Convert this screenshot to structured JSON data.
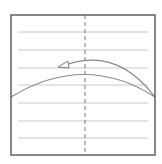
{
  "diagram": {
    "type": "origami-fold-step",
    "colors": {
      "background": "#ffffff",
      "border": "#555555",
      "crease": "#c8c8c8",
      "center_dash": "#777777",
      "curve": "#888888",
      "arrow": "#777777"
    },
    "square": {
      "x": 11,
      "y": 15,
      "w": 144,
      "h": 140
    },
    "center_line": {
      "x": 85,
      "y1": 15,
      "y2": 155,
      "style": "dashed"
    },
    "crease_lines": [
      {
        "y": 32
      },
      {
        "y": 50
      },
      {
        "y": 68
      },
      {
        "y": 85
      },
      {
        "y": 103
      },
      {
        "y": 121
      },
      {
        "y": 138
      }
    ],
    "crease_inset": {
      "x1": 18,
      "x2": 148
    },
    "fold_curve": {
      "start": [
        11,
        97
      ],
      "control": [
        85,
        52
      ],
      "end": [
        155,
        97
      ]
    },
    "arrow_curve": {
      "start": [
        155,
        97
      ],
      "control": [
        118,
        48
      ],
      "end": [
        68,
        64
      ]
    },
    "arrowhead": {
      "tip": [
        58,
        67
      ],
      "points": [
        [
          58,
          67
        ],
        [
          68,
          61
        ],
        [
          69,
          68
        ]
      ]
    }
  }
}
